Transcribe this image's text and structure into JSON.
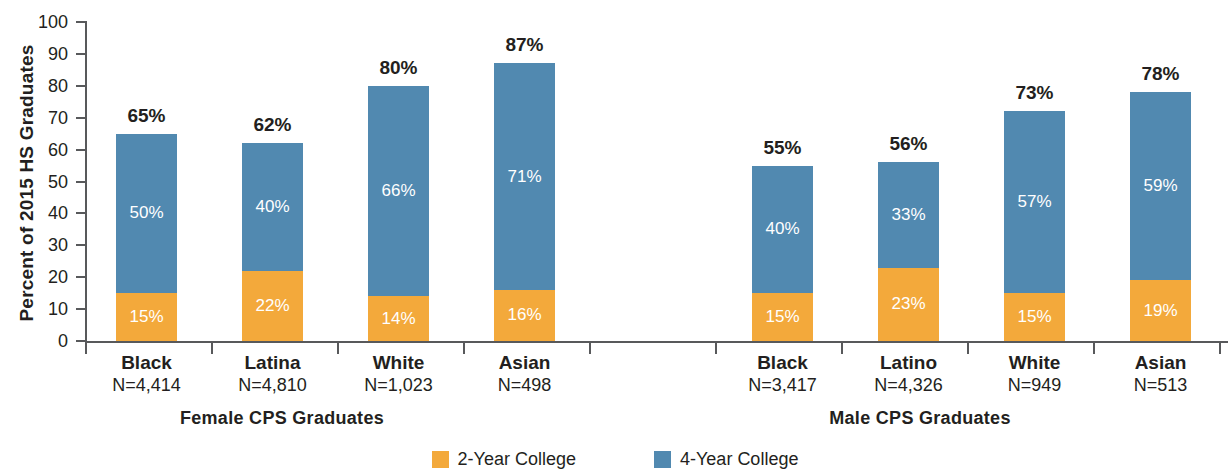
{
  "chart_data": {
    "type": "bar",
    "subtype": "stacked-bar",
    "title": "",
    "xlabel": "",
    "ylabel": "Percent of 2015 HS Graduates",
    "ylim": [
      0,
      100
    ],
    "ytick_labels": [
      "0",
      "10",
      "20",
      "30",
      "40",
      "50",
      "60",
      "70",
      "80",
      "90",
      "100"
    ],
    "ytick_values": [
      0,
      10,
      20,
      30,
      40,
      50,
      60,
      70,
      80,
      90,
      100
    ],
    "grid": false,
    "legend_position": "bottom-center",
    "legend": [
      "2-Year College",
      "4-Year College"
    ],
    "colors": {
      "two_year": "#F3A93B",
      "four_year": "#5189B0",
      "axis": "#58595b",
      "text": "#231f20",
      "segment_label": "#ffffff"
    },
    "groups": [
      {
        "name": "Female CPS Graduates",
        "categories": [
          "Black",
          "Latina",
          "White",
          "Asian"
        ],
        "sample_sizes": [
          "N=4,414",
          "N=4,810",
          "N=1,023",
          "N=498"
        ],
        "two_year": [
          15,
          22,
          14,
          16
        ],
        "four_year": [
          50,
          40,
          66,
          71
        ],
        "totals": [
          65,
          62,
          80,
          87
        ]
      },
      {
        "name": "Male CPS Graduates",
        "categories": [
          "Black",
          "Latino",
          "White",
          "Asian"
        ],
        "sample_sizes": [
          "N=3,417",
          "N=4,326",
          "N=949",
          "N=513"
        ],
        "two_year": [
          15,
          23,
          15,
          19
        ],
        "four_year": [
          40,
          33,
          57,
          59
        ],
        "totals": [
          55,
          56,
          73,
          78
        ]
      }
    ],
    "series": [
      {
        "name": "2-Year College",
        "color": "#F3A93B",
        "values": [
          15,
          22,
          14,
          16,
          15,
          23,
          15,
          19
        ]
      },
      {
        "name": "4-Year College",
        "color": "#5189B0",
        "values": [
          50,
          40,
          66,
          71,
          40,
          33,
          57,
          59
        ]
      }
    ],
    "x_categories_flat": [
      "Female Black",
      "Female Latina",
      "Female White",
      "Female Asian",
      "Male Black",
      "Male Latino",
      "Male White",
      "Male Asian"
    ],
    "totals_flat": [
      65,
      62,
      80,
      87,
      55,
      56,
      73,
      78
    ]
  },
  "bars": [
    {
      "total": "65%",
      "two_year": "15%",
      "four_year": "50%"
    },
    {
      "total": "62%",
      "two_year": "22%",
      "four_year": "40%"
    },
    {
      "total": "80%",
      "two_year": "14%",
      "four_year": "66%"
    },
    {
      "total": "87%",
      "two_year": "16%",
      "four_year": "71%"
    },
    {
      "total": "55%",
      "two_year": "15%",
      "four_year": "40%"
    },
    {
      "total": "56%",
      "two_year": "23%",
      "four_year": "33%"
    },
    {
      "total": "73%",
      "two_year": "15%",
      "four_year": "57%"
    },
    {
      "total": "78%",
      "two_year": "19%",
      "four_year": "59%"
    }
  ],
  "categories": [
    {
      "name": "Black",
      "n": "N=4,414"
    },
    {
      "name": "Latina",
      "n": "N=4,810"
    },
    {
      "name": "White",
      "n": "N=1,023"
    },
    {
      "name": "Asian",
      "n": "N=498"
    },
    {
      "name": "Black",
      "n": "N=3,417"
    },
    {
      "name": "Latino",
      "n": "N=4,326"
    },
    {
      "name": "White",
      "n": "N=949"
    },
    {
      "name": "Asian",
      "n": "N=513"
    }
  ],
  "group_labels": {
    "female": "Female CPS Graduates",
    "male": "Male CPS Graduates"
  },
  "axis": {
    "y_title": "Percent of 2015 HS Graduates",
    "ticks": [
      "100",
      "90",
      "80",
      "70",
      "60",
      "50",
      "40",
      "30",
      "20",
      "10",
      "0"
    ]
  },
  "legend": {
    "items": [
      {
        "label": "2-Year College",
        "color": "#F3A93B"
      },
      {
        "label": "4-Year College",
        "color": "#5189B0"
      }
    ]
  }
}
